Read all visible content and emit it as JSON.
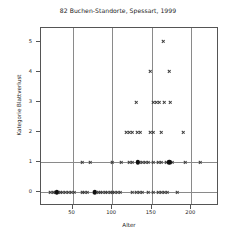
{
  "chart_data": {
    "type": "scatter",
    "title": "82 Buchen-Standorte, Spessart, 1999",
    "xlabel": "Alter",
    "ylabel": "Kategorie Blattverlust",
    "xlim": [
      10,
      235
    ],
    "ylim": [
      -0.45,
      5.45
    ],
    "xticks": [
      50,
      100,
      150,
      200
    ],
    "yticks": [
      0,
      1,
      2,
      3,
      4,
      5
    ],
    "grid": "vertical gridlines at x ticks, horizontal gridlines at y = 0 and y = 1",
    "legend": "none",
    "marker_styles": {
      "cross": "small x-shaped marker, single observation",
      "dot": "filled black circle, overplotted / multiple observations"
    },
    "series": [
      {
        "name": "Beobachtungen",
        "marker": "cross",
        "points": [
          [
            22,
            0
          ],
          [
            25,
            0
          ],
          [
            28,
            0
          ],
          [
            31,
            0
          ],
          [
            34,
            0
          ],
          [
            37,
            0
          ],
          [
            41,
            0
          ],
          [
            44,
            0
          ],
          [
            48,
            0
          ],
          [
            52,
            0
          ],
          [
            62,
            0
          ],
          [
            65,
            0
          ],
          [
            68,
            0
          ],
          [
            78,
            0
          ],
          [
            82,
            0
          ],
          [
            85,
            0
          ],
          [
            88,
            0
          ],
          [
            91,
            0
          ],
          [
            94,
            0
          ],
          [
            97,
            0
          ],
          [
            100,
            0
          ],
          [
            103,
            0
          ],
          [
            106,
            0
          ],
          [
            110,
            0
          ],
          [
            126,
            0
          ],
          [
            130,
            0
          ],
          [
            134,
            0
          ],
          [
            138,
            0
          ],
          [
            146,
            0
          ],
          [
            152,
            0
          ],
          [
            158,
            0
          ],
          [
            162,
            0
          ],
          [
            166,
            0
          ],
          [
            170,
            0
          ],
          [
            182,
            0
          ],
          [
            62,
            1
          ],
          [
            72,
            1
          ],
          [
            100,
            1
          ],
          [
            112,
            1
          ],
          [
            122,
            1
          ],
          [
            126,
            1
          ],
          [
            134,
            1
          ],
          [
            138,
            1
          ],
          [
            142,
            1
          ],
          [
            146,
            1
          ],
          [
            152,
            1
          ],
          [
            158,
            1
          ],
          [
            162,
            1
          ],
          [
            168,
            1
          ],
          [
            172,
            1
          ],
          [
            176,
            1
          ],
          [
            192,
            1
          ],
          [
            212,
            1
          ],
          [
            118,
            2
          ],
          [
            122,
            2
          ],
          [
            126,
            2
          ],
          [
            132,
            2
          ],
          [
            136,
            2
          ],
          [
            148,
            2
          ],
          [
            152,
            2
          ],
          [
            162,
            2
          ],
          [
            190,
            2
          ],
          [
            130,
            3
          ],
          [
            152,
            3
          ],
          [
            156,
            3
          ],
          [
            160,
            3
          ],
          [
            166,
            3
          ],
          [
            174,
            3
          ],
          [
            148,
            4
          ],
          [
            172,
            4
          ],
          [
            164,
            5
          ]
        ]
      },
      {
        "name": "Mehrfachbeobachtungen",
        "marker": "dot",
        "points": [
          [
            30,
            0
          ],
          [
            78,
            0
          ],
          [
            132,
            1
          ],
          [
            172,
            1
          ]
        ]
      }
    ]
  },
  "axes": {
    "x_tick_labels": [
      "50",
      "100",
      "150",
      "200"
    ],
    "y_tick_labels": [
      "0",
      "1",
      "2",
      "3",
      "4",
      "5"
    ]
  }
}
